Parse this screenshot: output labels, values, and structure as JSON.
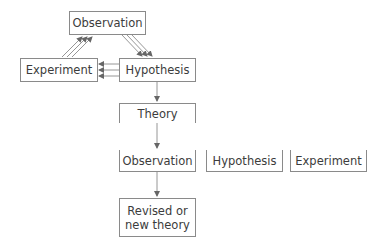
{
  "cycle": {
    "observation": "Observation",
    "experiment": "Experiment",
    "hypothesis": "Hypothesis"
  },
  "theory": "Theory",
  "tests": [
    {
      "label": "Observation"
    },
    {
      "label": "Hypothesis"
    },
    {
      "label": "Experiment"
    }
  ],
  "result": {
    "line1": "Revised or",
    "line2": "new theory"
  },
  "colors": {
    "line": "#8a8a8a",
    "arrow": "#666666"
  }
}
